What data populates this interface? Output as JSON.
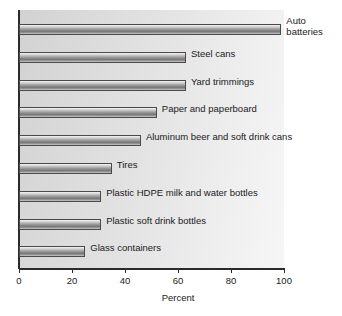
{
  "chart_data": {
    "type": "bar",
    "orientation": "horizontal",
    "title": "",
    "xlabel": "Percent",
    "ylabel": "",
    "xlim": [
      0,
      100
    ],
    "xticks": [
      0,
      20,
      40,
      60,
      80,
      100
    ],
    "grid": false,
    "legend": "none",
    "categories": [
      "Auto batteries",
      "Steel cans",
      "Yard trimmings",
      "Paper and paperboard",
      "Aluminum beer and soft drink cans",
      "Tires",
      "Plastic HDPE milk and water bottles",
      "Plastic soft drink bottles",
      "Glass containers"
    ],
    "values": [
      99,
      63,
      63,
      52,
      46,
      35,
      31,
      31,
      25
    ],
    "bars": [
      {
        "label_line1": "Auto",
        "label_line2": "batteries",
        "value": 99
      },
      {
        "label_line1": "Steel cans",
        "label_line2": "",
        "value": 63
      },
      {
        "label_line1": "Yard trimmings",
        "label_line2": "",
        "value": 63
      },
      {
        "label_line1": "Paper and paperboard",
        "label_line2": "",
        "value": 52
      },
      {
        "label_line1": "Aluminum beer and soft drink cans",
        "label_line2": "",
        "value": 46
      },
      {
        "label_line1": "Tires",
        "label_line2": "",
        "value": 35
      },
      {
        "label_line1": "Plastic HDPE milk and water bottles",
        "label_line2": "",
        "value": 31
      },
      {
        "label_line1": "Plastic soft drink bottles",
        "label_line2": "",
        "value": 31
      },
      {
        "label_line1": "Glass containers",
        "label_line2": "",
        "value": 25
      }
    ],
    "tick_labels": [
      "0",
      "20",
      "40",
      "60",
      "80",
      "100"
    ],
    "colors": {
      "bar_light": "#f2f2f2",
      "bar_dark": "#7a7a7a",
      "bar_border": "#4a4a4a",
      "axis": "#2b2b2b",
      "plot_background": "#e2e2e2",
      "text": "#1a1a1a"
    }
  }
}
